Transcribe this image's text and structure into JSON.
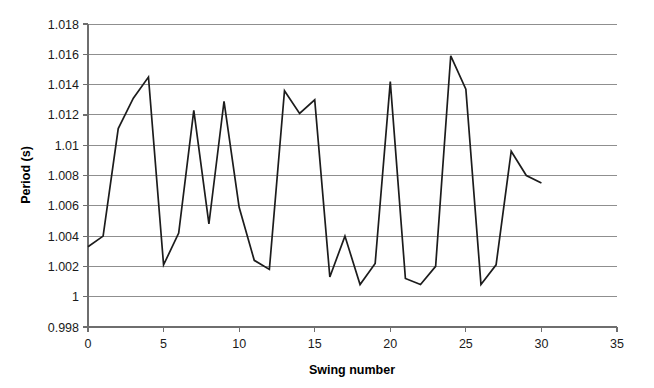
{
  "chart_data": {
    "type": "line",
    "title": "",
    "xlabel": "Swing number",
    "ylabel": "Period (s)",
    "xlim": [
      0,
      35
    ],
    "ylim": [
      0.998,
      1.018
    ],
    "grid": true,
    "legend": false,
    "xticks": [
      0,
      5,
      10,
      15,
      20,
      25,
      30,
      35
    ],
    "xtick_labels": [
      "0",
      "5",
      "10",
      "15",
      "20",
      "25",
      "30",
      "35"
    ],
    "yticks": [
      0.998,
      1.0,
      1.002,
      1.004,
      1.006,
      1.008,
      1.01,
      1.012,
      1.014,
      1.016,
      1.018
    ],
    "ytick_labels": [
      "0.998",
      "1",
      "1.002",
      "1.004",
      "1.006",
      "1.008",
      "1.01",
      "1.012",
      "1.014",
      "1.016",
      "1.018"
    ],
    "line_color": "#1c1c1c",
    "grid_color": "#8f8f8f",
    "axis_color": "#6e6e6e",
    "x": [
      0,
      1,
      2,
      3,
      4,
      5,
      6,
      7,
      8,
      9,
      10,
      11,
      12,
      13,
      14,
      15,
      16,
      17,
      18,
      19,
      20,
      21,
      22,
      23,
      24,
      25,
      26,
      27,
      28,
      29,
      30
    ],
    "values": [
      1.0033,
      1.004,
      1.0111,
      1.0131,
      1.0145,
      1.0021,
      1.0042,
      1.0123,
      1.0048,
      1.0129,
      1.0059,
      1.0024,
      1.0018,
      1.0136,
      1.0121,
      1.013,
      1.0013,
      1.004,
      1.0008,
      1.0022,
      1.0142,
      1.0012,
      1.0008,
      1.002,
      1.0159,
      1.0137,
      1.0008,
      1.0021,
      1.0096,
      1.008,
      1.0075
    ],
    "series": [
      {
        "name": "Period",
        "values": [
          1.0033,
          1.004,
          1.0111,
          1.0131,
          1.0145,
          1.0021,
          1.0042,
          1.0123,
          1.0048,
          1.0129,
          1.0059,
          1.0024,
          1.0018,
          1.0136,
          1.0121,
          1.013,
          1.0013,
          1.004,
          1.0008,
          1.0022,
          1.0142,
          1.0012,
          1.0008,
          1.002,
          1.0159,
          1.0137,
          1.0008,
          1.0021,
          1.0096,
          1.008,
          1.0075
        ]
      }
    ]
  },
  "layout": {
    "plot_left": 88,
    "plot_right": 617,
    "plot_top": 24,
    "plot_bottom": 327
  }
}
